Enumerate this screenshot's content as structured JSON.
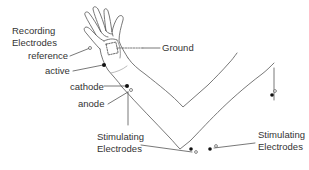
{
  "diagram": {
    "type": "nerve-conduction-setup",
    "labels": {
      "recording_title_line1": "Recording",
      "recording_title_line2": "Electrodes",
      "reference": "reference",
      "active": "active",
      "ground": "Ground",
      "cathode": "cathode",
      "anode": "anode",
      "stim_wrist_line1": "Stimulating",
      "stim_wrist_line2": "Electrodes",
      "stim_right_line1": "Stimulating",
      "stim_right_line2": "Electrodes"
    },
    "colors": {
      "line": "#555555",
      "text": "#333333",
      "electrode_filled": "#111111",
      "background": "#ffffff"
    },
    "electrode_legend": {
      "filled_dot": "cathode / active",
      "open_dot": "anode / reference"
    }
  }
}
